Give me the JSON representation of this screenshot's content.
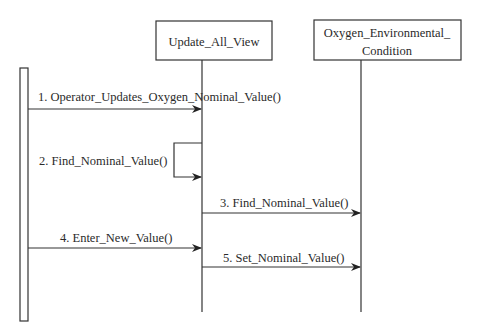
{
  "diagram": {
    "type": "sequence",
    "colors": {
      "line": "#333333",
      "background": "#ffffff",
      "text": "#2a2a2a"
    },
    "actor": {
      "name": "operator-actor-bar"
    },
    "lifelines": [
      {
        "id": "update_all_view",
        "label_lines": [
          "Update_All_View"
        ]
      },
      {
        "id": "oxygen_environmental_condition",
        "label_lines": [
          "Oxygen_Environmental_",
          "Condition"
        ]
      }
    ],
    "messages": [
      {
        "num": 1,
        "label": "1. Operator_Updates_Oxygen_Nominal_Value()",
        "from": "actor",
        "to": "update_all_view"
      },
      {
        "num": 2,
        "label": "2. Find_Nominal_Value()",
        "from": "update_all_view",
        "to": "update_all_view"
      },
      {
        "num": 3,
        "label": "3. Find_Nominal_Value()",
        "from": "update_all_view",
        "to": "oxygen_environmental_condition"
      },
      {
        "num": 4,
        "label": "4. Enter_New_Value()",
        "from": "actor",
        "to": "update_all_view"
      },
      {
        "num": 5,
        "label": "5. Set_Nominal_Value()",
        "from": "update_all_view",
        "to": "oxygen_environmental_condition"
      }
    ]
  }
}
